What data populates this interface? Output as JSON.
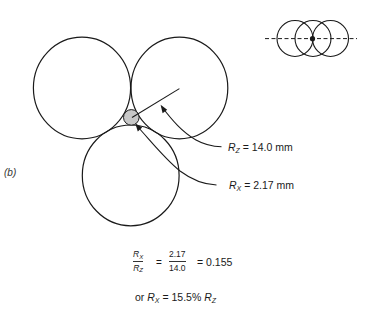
{
  "figure": {
    "panel_label": "(b)",
    "colors": {
      "stroke": "#1a1a1a",
      "small_circle_fill": "#c8c8c8",
      "background": "#ffffff"
    },
    "large_spheres": [
      {
        "name": "top-left",
        "cx": 82,
        "cy": 88,
        "rx": 48.6,
        "ry": 50.8
      },
      {
        "name": "top-right",
        "cx": 179.4,
        "cy": 88,
        "rx": 48.4,
        "ry": 50.8
      },
      {
        "name": "bottom",
        "cx": 130.7,
        "cy": 175.4,
        "rx": 48.4,
        "ry": 50.4
      }
    ],
    "small_sphere": {
      "cx": 131.3,
      "cy": 117.4,
      "r": 7.8
    },
    "labels": {
      "rz": {
        "symbol": "R",
        "subscript": "Z",
        "value_text": "= 14.0 mm"
      },
      "rx": {
        "symbol": "R",
        "subscript": "X",
        "value_text": "= 2.17 mm"
      }
    },
    "inset": {
      "description": "three overlapping spheres viewed from side with dashed center line and center dot",
      "circles": [
        {
          "cx": 295,
          "cy": 38.5,
          "r": 18
        },
        {
          "cx": 313,
          "cy": 38.5,
          "r": 18
        },
        {
          "cx": 330.5,
          "cy": 38.5,
          "r": 18
        }
      ],
      "dot": {
        "cx": 312.5,
        "cy": 38.7,
        "r": 2.6
      }
    }
  },
  "equation": {
    "ratio_num_symbol": "R",
    "ratio_num_sub": "X",
    "ratio_den_symbol": "R",
    "ratio_den_sub": "Z",
    "equals1": "=",
    "value_num": "2.17",
    "value_den": "14.0",
    "result": "= 0.155",
    "line2_prefix": "or",
    "line2_symbol": "R",
    "line2_sub": "X",
    "line2_middle": "= 15.5%",
    "line2_symbol2": "R",
    "line2_sub2": "Z"
  }
}
